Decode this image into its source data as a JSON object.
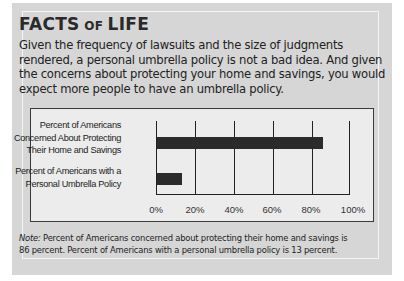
{
  "title": {
    "part1": "FACTS",
    "part2": "OF",
    "part3": "LIFE"
  },
  "body_text": "Given the frequency of lawsuits and the size of judgments rendered, a personal umbrella policy is not a bad idea. And given the concerns about protecting your home and savings, you would expect more people to have an umbrella policy.",
  "body_lines": [
    "Given the frequency of lawsuits and the size of judgments",
    "rendered, a personal umbrella policy is not a bad idea. And given",
    "the concerns about protecting your home and savings, you would",
    "expect more people to have an umbrella policy."
  ],
  "chart": {
    "categories": [
      {
        "lines": [
          "Percent of Americans",
          "Concerned About Protecting",
          "Their Home and Savings"
        ]
      },
      {
        "lines": [
          "Percent of Americans with a",
          "Personal Umbrella Policy"
        ]
      }
    ],
    "ticks": [
      "0%",
      "20%",
      "40%",
      "60%",
      "80%",
      "100%"
    ]
  },
  "note": {
    "label": "Note:",
    "line1": " Percent of Americans concerned about protecting their home and savings is",
    "line2": "86 percent. Percent of Americans with a personal umbrella policy is 13 percent."
  },
  "colors": {
    "panel": "#d6d6d6",
    "chart_bg": "#ececec",
    "bar": "#2b2b2b"
  },
  "chart_data": {
    "type": "bar",
    "orientation": "horizontal",
    "title": "",
    "categories": [
      "Percent of Americans Concerned About Protecting Their Home and Savings",
      "Percent of Americans with a Personal Umbrella Policy"
    ],
    "values": [
      86,
      13
    ],
    "xlabel": "",
    "ylabel": "",
    "xlim": [
      0,
      100
    ],
    "x_tick_labels": [
      "0%",
      "20%",
      "40%",
      "60%",
      "80%",
      "100%"
    ],
    "grid": true,
    "legend": null
  }
}
